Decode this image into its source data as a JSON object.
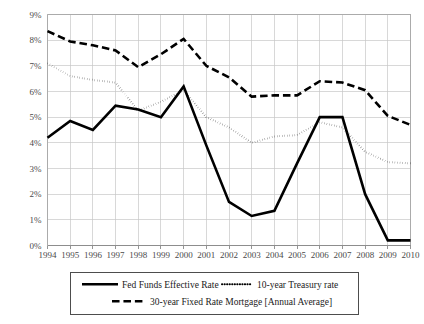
{
  "chart_data": {
    "type": "line",
    "title": "",
    "subtitle": "",
    "xlabel": "",
    "ylabel": "",
    "grid": true,
    "legend_position": "bottom",
    "xlim": [
      1994,
      2010
    ],
    "ylim": [
      0,
      9
    ],
    "ytick_step": 1,
    "x": [
      1994,
      1995,
      1996,
      1997,
      1998,
      1999,
      2000,
      2001,
      2002,
      2003,
      2004,
      2005,
      2006,
      2007,
      2008,
      2009,
      2010
    ],
    "categories": [
      "1994",
      "1995",
      "1996",
      "1997",
      "1998",
      "1999",
      "2000",
      "2001",
      "2002",
      "2003",
      "2004",
      "2005",
      "2006",
      "2007",
      "2008",
      "2009",
      "2010"
    ],
    "ytick_labels": [
      "0%",
      "1%",
      "2%",
      "3%",
      "4%",
      "5%",
      "6%",
      "7%",
      "8%",
      "9%"
    ],
    "ytick_values": [
      0,
      1,
      2,
      3,
      4,
      5,
      6,
      7,
      8,
      9
    ],
    "series": [
      {
        "name": "Fed Funds Effective Rate",
        "style": "solid",
        "color": "#000000",
        "width": 2.6,
        "values": [
          4.2,
          4.85,
          4.5,
          5.45,
          5.3,
          5.0,
          6.2,
          3.9,
          1.7,
          1.15,
          1.35,
          3.2,
          5.0,
          5.0,
          2.0,
          0.2,
          0.2
        ]
      },
      {
        "name": "10-year Treasury rate",
        "style": "dotted",
        "color": "#000000",
        "width": 2.0,
        "values": [
          7.1,
          6.6,
          6.45,
          6.35,
          5.25,
          5.6,
          6.05,
          5.0,
          4.6,
          4.0,
          4.25,
          4.3,
          4.8,
          4.6,
          3.65,
          3.25,
          3.2
        ]
      },
      {
        "name": "30-year Fixed Rate Mortgage [Annual Average]",
        "style": "dashed",
        "color": "#000000",
        "width": 2.6,
        "values": [
          8.35,
          7.95,
          7.8,
          7.6,
          6.95,
          7.45,
          8.05,
          7.0,
          6.55,
          5.8,
          5.85,
          5.85,
          6.4,
          6.35,
          6.05,
          5.05,
          4.7
        ]
      }
    ]
  },
  "legend": {
    "entries": [
      {
        "label": "Fed Funds Effective Rate",
        "style": "solid"
      },
      {
        "label": "10-year Treasury rate",
        "style": "dotted"
      },
      {
        "label": "30-year Fixed Rate Mortgage [Annual Average]",
        "style": "dashed"
      }
    ]
  },
  "colors": {
    "grid": "#c8c8c8",
    "axis": "#8a8a8a",
    "series": "#000000",
    "tick_text": "#4a4a4a",
    "legend_text": "#1a1a1a",
    "background": "#ffffff"
  }
}
